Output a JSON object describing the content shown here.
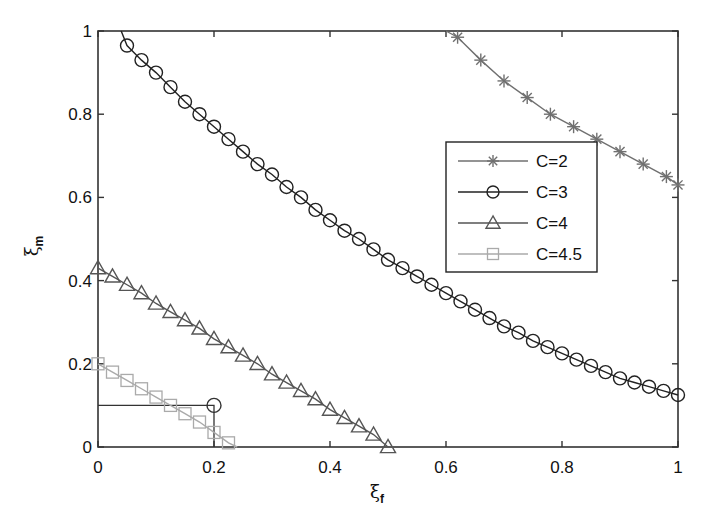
{
  "chart_data": {
    "type": "line",
    "title": "",
    "xlabel": "ξ_f",
    "ylabel": "ξ_m",
    "xlim": [
      0,
      1
    ],
    "ylim": [
      0,
      1
    ],
    "xticks": [
      "0",
      "0.2",
      "0.4",
      "0.6",
      "0.8",
      "1"
    ],
    "yticks": [
      "0",
      "0.2",
      "0.4",
      "0.6",
      "0.8",
      "1"
    ],
    "grid": false,
    "legend_position": "upper right (inside)",
    "series": [
      {
        "name": "C=2",
        "marker": "asterisk",
        "color": "#707070",
        "line_start": [
          0.6,
          1.0
        ],
        "x": [
          0.62,
          0.66,
          0.7,
          0.74,
          0.78,
          0.82,
          0.86,
          0.9,
          0.94,
          0.98,
          1.0
        ],
        "y": [
          0.985,
          0.93,
          0.88,
          0.84,
          0.8,
          0.77,
          0.74,
          0.71,
          0.68,
          0.65,
          0.63
        ]
      },
      {
        "name": "C=3",
        "marker": "circle",
        "color": "#222222",
        "line_start": [
          0.04,
          1.0
        ],
        "x": [
          0.05,
          0.075,
          0.1,
          0.125,
          0.15,
          0.175,
          0.2,
          0.225,
          0.25,
          0.275,
          0.3,
          0.325,
          0.35,
          0.375,
          0.4,
          0.425,
          0.45,
          0.475,
          0.5,
          0.525,
          0.55,
          0.575,
          0.6,
          0.625,
          0.65,
          0.675,
          0.7,
          0.725,
          0.75,
          0.775,
          0.8,
          0.825,
          0.85,
          0.875,
          0.9,
          0.925,
          0.95,
          0.975,
          1.0
        ],
        "y": [
          0.965,
          0.93,
          0.9,
          0.865,
          0.83,
          0.8,
          0.77,
          0.74,
          0.71,
          0.68,
          0.655,
          0.625,
          0.6,
          0.57,
          0.545,
          0.52,
          0.5,
          0.475,
          0.45,
          0.43,
          0.41,
          0.39,
          0.37,
          0.35,
          0.33,
          0.31,
          0.29,
          0.275,
          0.255,
          0.24,
          0.225,
          0.21,
          0.195,
          0.18,
          0.165,
          0.155,
          0.145,
          0.135,
          0.125
        ]
      },
      {
        "name": "C=4",
        "marker": "triangle",
        "color": "#555555",
        "x": [
          0,
          0.025,
          0.05,
          0.075,
          0.1,
          0.125,
          0.15,
          0.175,
          0.2,
          0.225,
          0.25,
          0.275,
          0.3,
          0.325,
          0.35,
          0.375,
          0.4,
          0.425,
          0.45,
          0.475,
          0.5
        ],
        "y": [
          0.43,
          0.41,
          0.39,
          0.37,
          0.345,
          0.325,
          0.305,
          0.285,
          0.26,
          0.24,
          0.22,
          0.2,
          0.175,
          0.155,
          0.135,
          0.115,
          0.09,
          0.07,
          0.05,
          0.03,
          0.0
        ]
      },
      {
        "name": "C=4.5",
        "marker": "square",
        "color": "#aaaaaa",
        "x": [
          0,
          0.025,
          0.05,
          0.075,
          0.1,
          0.125,
          0.15,
          0.175,
          0.2,
          0.225,
          0.24
        ],
        "y": [
          0.2,
          0.18,
          0.16,
          0.14,
          0.12,
          0.1,
          0.08,
          0.06,
          0.035,
          0.01,
          0.0
        ]
      }
    ],
    "annotations": [
      {
        "type": "guide-line",
        "points": [
          [
            0,
            0.1
          ],
          [
            0.2,
            0.1
          ],
          [
            0.2,
            0
          ]
        ],
        "marker_at": [
          0.2,
          0.1
        ],
        "marker": "circle"
      }
    ]
  }
}
